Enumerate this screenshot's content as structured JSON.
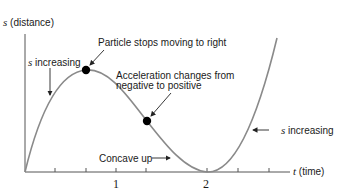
{
  "diagram": {
    "y_axis": {
      "var": "s",
      "label": "(distance)"
    },
    "x_axis": {
      "var": "t",
      "label": "(time)"
    },
    "ticks": [
      "1",
      "2"
    ],
    "annotations": {
      "s_increasing_left": {
        "var": "s",
        "text": "increasing"
      },
      "particle_stops": "Particle stops moving to right",
      "accel_line1": "Acceleration changes from",
      "accel_line2": "negative to positive",
      "concave_up": "Concave up",
      "s_increasing_right": {
        "var": "s",
        "text": "increasing"
      }
    },
    "colors": {
      "curve": "#8a8a8a",
      "axis": "#555555",
      "text": "#1a1a1a",
      "dot": "#000000"
    }
  }
}
